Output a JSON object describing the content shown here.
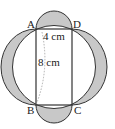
{
  "diagram": {
    "vertices": {
      "A": "A",
      "B": "B",
      "C": "C",
      "D": "D"
    },
    "labels": {
      "width": "4 cm",
      "diagonal": "8 cm"
    },
    "colors": {
      "shade": "#c8c8c8",
      "stroke": "#333333",
      "dotted": "#999999"
    }
  }
}
